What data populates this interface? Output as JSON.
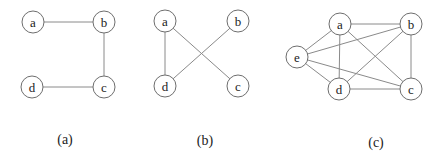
{
  "style": {
    "edge_color": "#8a8a8a",
    "node_stroke": "#6e6e6e",
    "node_fill": "#ffffff",
    "text_color": "#222222",
    "node_radius": 11
  },
  "graphs": [
    {
      "id": "a",
      "caption": "(a)",
      "caption_pos": [
        65,
        139
      ],
      "nodes": [
        {
          "id": "a",
          "label": "a",
          "x": 33,
          "y": 22
        },
        {
          "id": "b",
          "label": "b",
          "x": 104,
          "y": 22
        },
        {
          "id": "c",
          "label": "c",
          "x": 104,
          "y": 87
        },
        {
          "id": "d",
          "label": "d",
          "x": 32,
          "y": 87
        }
      ],
      "edges": [
        [
          "a",
          "b"
        ],
        [
          "b",
          "c"
        ],
        [
          "c",
          "d"
        ]
      ]
    },
    {
      "id": "b",
      "caption": "(b)",
      "caption_pos": [
        205,
        140
      ],
      "nodes": [
        {
          "id": "a",
          "label": "a",
          "x": 165,
          "y": 21
        },
        {
          "id": "b",
          "label": "b",
          "x": 238,
          "y": 21
        },
        {
          "id": "c",
          "label": "c",
          "x": 238,
          "y": 86
        },
        {
          "id": "d",
          "label": "d",
          "x": 165,
          "y": 86
        }
      ],
      "edges": [
        [
          "a",
          "d"
        ],
        [
          "a",
          "c"
        ],
        [
          "b",
          "d"
        ]
      ]
    },
    {
      "id": "c",
      "caption": "(c)",
      "caption_pos": [
        376,
        142
      ],
      "nodes": [
        {
          "id": "a",
          "label": "a",
          "x": 340,
          "y": 24
        },
        {
          "id": "b",
          "label": "b",
          "x": 411,
          "y": 24
        },
        {
          "id": "c",
          "label": "c",
          "x": 411,
          "y": 89
        },
        {
          "id": "d",
          "label": "d",
          "x": 339,
          "y": 89
        },
        {
          "id": "e",
          "label": "e",
          "x": 297,
          "y": 57
        }
      ],
      "edges": [
        [
          "a",
          "b"
        ],
        [
          "a",
          "c"
        ],
        [
          "a",
          "d"
        ],
        [
          "a",
          "e"
        ],
        [
          "b",
          "c"
        ],
        [
          "b",
          "d"
        ],
        [
          "b",
          "e"
        ],
        [
          "c",
          "d"
        ],
        [
          "c",
          "e"
        ],
        [
          "d",
          "e"
        ]
      ]
    }
  ]
}
